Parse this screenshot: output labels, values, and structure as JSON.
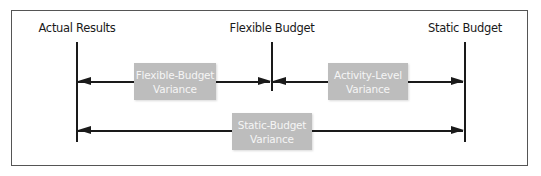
{
  "diagram": {
    "columns": [
      {
        "label": "Actual Results",
        "x": 77
      },
      {
        "label": "Flexible Budget",
        "x": 272
      },
      {
        "label": "Static Budget",
        "x": 465
      }
    ],
    "variances": [
      {
        "line1": "Flexible-Budget",
        "line2": "Variance",
        "from": "Actual Results",
        "to": "Flexible Budget"
      },
      {
        "line1": "Activity-Level",
        "line2": "Variance",
        "from": "Flexible Budget",
        "to": "Static Budget"
      },
      {
        "line1": "Static-Budget",
        "line2": "Variance",
        "from": "Actual Results",
        "to": "Static Budget"
      }
    ],
    "colors": {
      "box_fill": "#bdbdbd",
      "box_text": "#f5f5f5",
      "line": "#1a1a1a",
      "frame": "#555555"
    }
  }
}
